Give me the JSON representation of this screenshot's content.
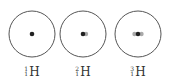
{
  "colors": {
    "orbit": "#555555",
    "proton": "#222222",
    "neutron": "#aaaaaa",
    "text": "#333333"
  },
  "atoms": [
    {
      "name": "protium",
      "symbol": "H",
      "mass_number": "1",
      "atomic_number": "1",
      "protons": 1,
      "neutrons": 0
    },
    {
      "name": "deuterium",
      "symbol": "H",
      "mass_number": "2",
      "atomic_number": "1",
      "protons": 1,
      "neutrons": 1
    },
    {
      "name": "tritium",
      "symbol": "H",
      "mass_number": "3",
      "atomic_number": "1",
      "protons": 1,
      "neutrons": 2
    }
  ]
}
